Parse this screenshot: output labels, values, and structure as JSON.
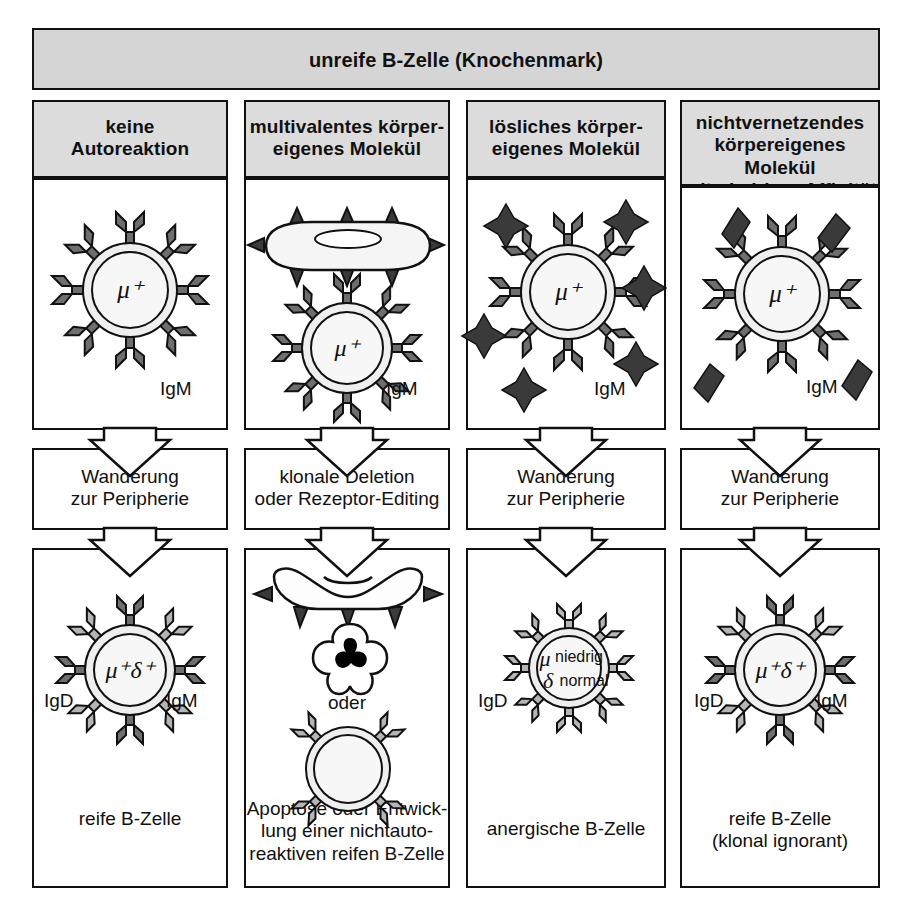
{
  "figure": {
    "language": "de",
    "title": "unreife B-Zelle (Knochenmark)",
    "colors": {
      "header_gray": "#d5d5d5",
      "cell_header_gray": "#dcdcdc",
      "stroke": "#111111",
      "igm_receptor": "#6e6e6e",
      "igd_receptor": "#b5b5b5",
      "antigen_dark": "#333333",
      "nucleus_black": "#000000",
      "page_bg": "#ffffff"
    }
  },
  "columns": [
    {
      "id": "col-1",
      "header": "keine\nAutoreaktion",
      "top_cell": {
        "nucleus_label": "μ⁺",
        "receptor_labels": [
          "IgM"
        ],
        "antigen": "none",
        "antigen_count": 0
      },
      "middle_label": "Wanderung\nzur Peripherie",
      "bottom_cell": {
        "nucleus_label": "μ⁺δ⁺",
        "receptor_labels": [
          "IgD",
          "IgM"
        ]
      },
      "outcome": "reife B-Zelle"
    },
    {
      "id": "col-2",
      "header": "multivalentes körper-\neigenes Molekül",
      "top_cell": {
        "nucleus_label": "μ⁺",
        "receptor_labels": [
          "IgM"
        ],
        "antigen": "multivalent-membrane-blob",
        "antigen_count": 1
      },
      "middle_label": "klonale Deletion\noder Rezeptor-Editing",
      "bottom_cell": {
        "nucleus_label": "",
        "receptor_labels": [],
        "apoptosis_label": "oder"
      },
      "outcome": "Apoptose oder Entwick-\nlung einer nichtauto-\nreaktiven reifen B-Zelle"
    },
    {
      "id": "col-3",
      "header": "lösliches körper-\neigenes Molekül",
      "top_cell": {
        "nucleus_label": "μ⁺",
        "receptor_labels": [
          "IgM"
        ],
        "antigen": "soluble-star",
        "antigen_count": 6
      },
      "middle_label": "Wanderung\nzur Peripherie",
      "bottom_cell": {
        "nucleus_label": "",
        "nucleus_mu": "μ",
        "nucleus_delta": "δ",
        "nucleus_mu_level": "niedrig",
        "nucleus_delta_level": "normal",
        "receptor_labels": [
          "IgD"
        ]
      },
      "outcome": "anergische B-Zelle"
    },
    {
      "id": "col-4",
      "header": "nichtvernetzendes\nkörpereigenes Molekül\nmit niedriger Affinität",
      "top_cell": {
        "nucleus_label": "μ⁺",
        "receptor_labels": [
          "IgM"
        ],
        "antigen": "low-affinity-diamond",
        "antigen_count": 4
      },
      "middle_label": "Wanderung\nzur Peripherie",
      "bottom_cell": {
        "nucleus_label": "μ⁺δ⁺",
        "receptor_labels": [
          "IgD",
          "IgM"
        ]
      },
      "outcome": "reife B-Zelle\n(klonal ignorant)"
    }
  ]
}
